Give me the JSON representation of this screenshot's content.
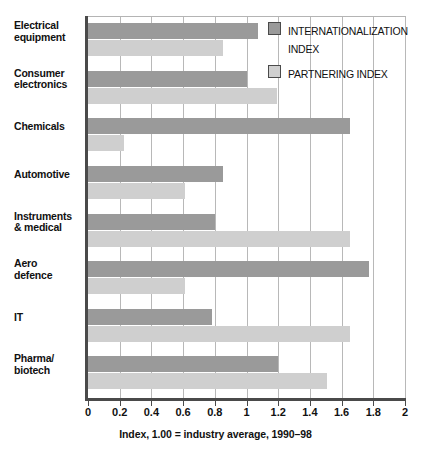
{
  "chart_data": {
    "type": "bar",
    "orientation": "horizontal",
    "title": "",
    "subtitle": "",
    "xlabel": "Index, 1.00 = industry average, 1990–98",
    "ylabel": "",
    "xlim": [
      0,
      2
    ],
    "xticks": [
      0,
      0.2,
      0.4,
      0.6,
      0.8,
      1,
      1.2,
      1.4,
      1.6,
      1.8,
      2
    ],
    "xtick_labels": [
      "0",
      "0.2",
      "0.4",
      "0.6",
      "0.8",
      "1",
      "1.2",
      "1.4",
      "1.6",
      "1.8",
      "2"
    ],
    "grid": true,
    "grid_axis": "x",
    "legend_position": "top-right",
    "categories": [
      "Electrical equipment",
      "Consumer electronics",
      "Chemicals",
      "Automotive",
      "Instruments & medical",
      "Aero defence",
      "IT",
      "Pharma/ biotech"
    ],
    "series": [
      {
        "name": "INTERNATIONALIZATION INDEX",
        "color": "#9a9a9a",
        "values": [
          1.07,
          1.0,
          1.65,
          0.85,
          0.8,
          1.77,
          0.78,
          1.2
        ]
      },
      {
        "name": "PARTNERING INDEX",
        "color": "#cfcfcf",
        "values": [
          0.85,
          1.19,
          0.23,
          0.61,
          1.65,
          0.61,
          1.65,
          1.51
        ]
      }
    ]
  },
  "categories_display": [
    {
      "line1": "Electrical",
      "line2": "equipment"
    },
    {
      "line1": "Consumer",
      "line2": "electronics"
    },
    {
      "line1": "Chemicals",
      "line2": ""
    },
    {
      "line1": "Automotive",
      "line2": ""
    },
    {
      "line1": "Instruments",
      "line2": "& medical"
    },
    {
      "line1": "Aero",
      "line2": "defence"
    },
    {
      "line1": "IT",
      "line2": ""
    },
    {
      "line1": "Pharma/",
      "line2": "biotech"
    }
  ],
  "legend": {
    "items": [
      {
        "label": "INTERNATIONALIZATION INDEX",
        "swatch": "dark"
      },
      {
        "label": "PARTNERING INDEX",
        "swatch": "light"
      }
    ]
  },
  "caption": "Index, 1.00 = industry average, 1990–98",
  "colors": {
    "internationalization": "#9a9a9a",
    "partnering": "#cfcfcf",
    "axis": "#4a4a4a",
    "gridline": "#b8b8b8",
    "text": "#111111",
    "background": "#ffffff"
  }
}
